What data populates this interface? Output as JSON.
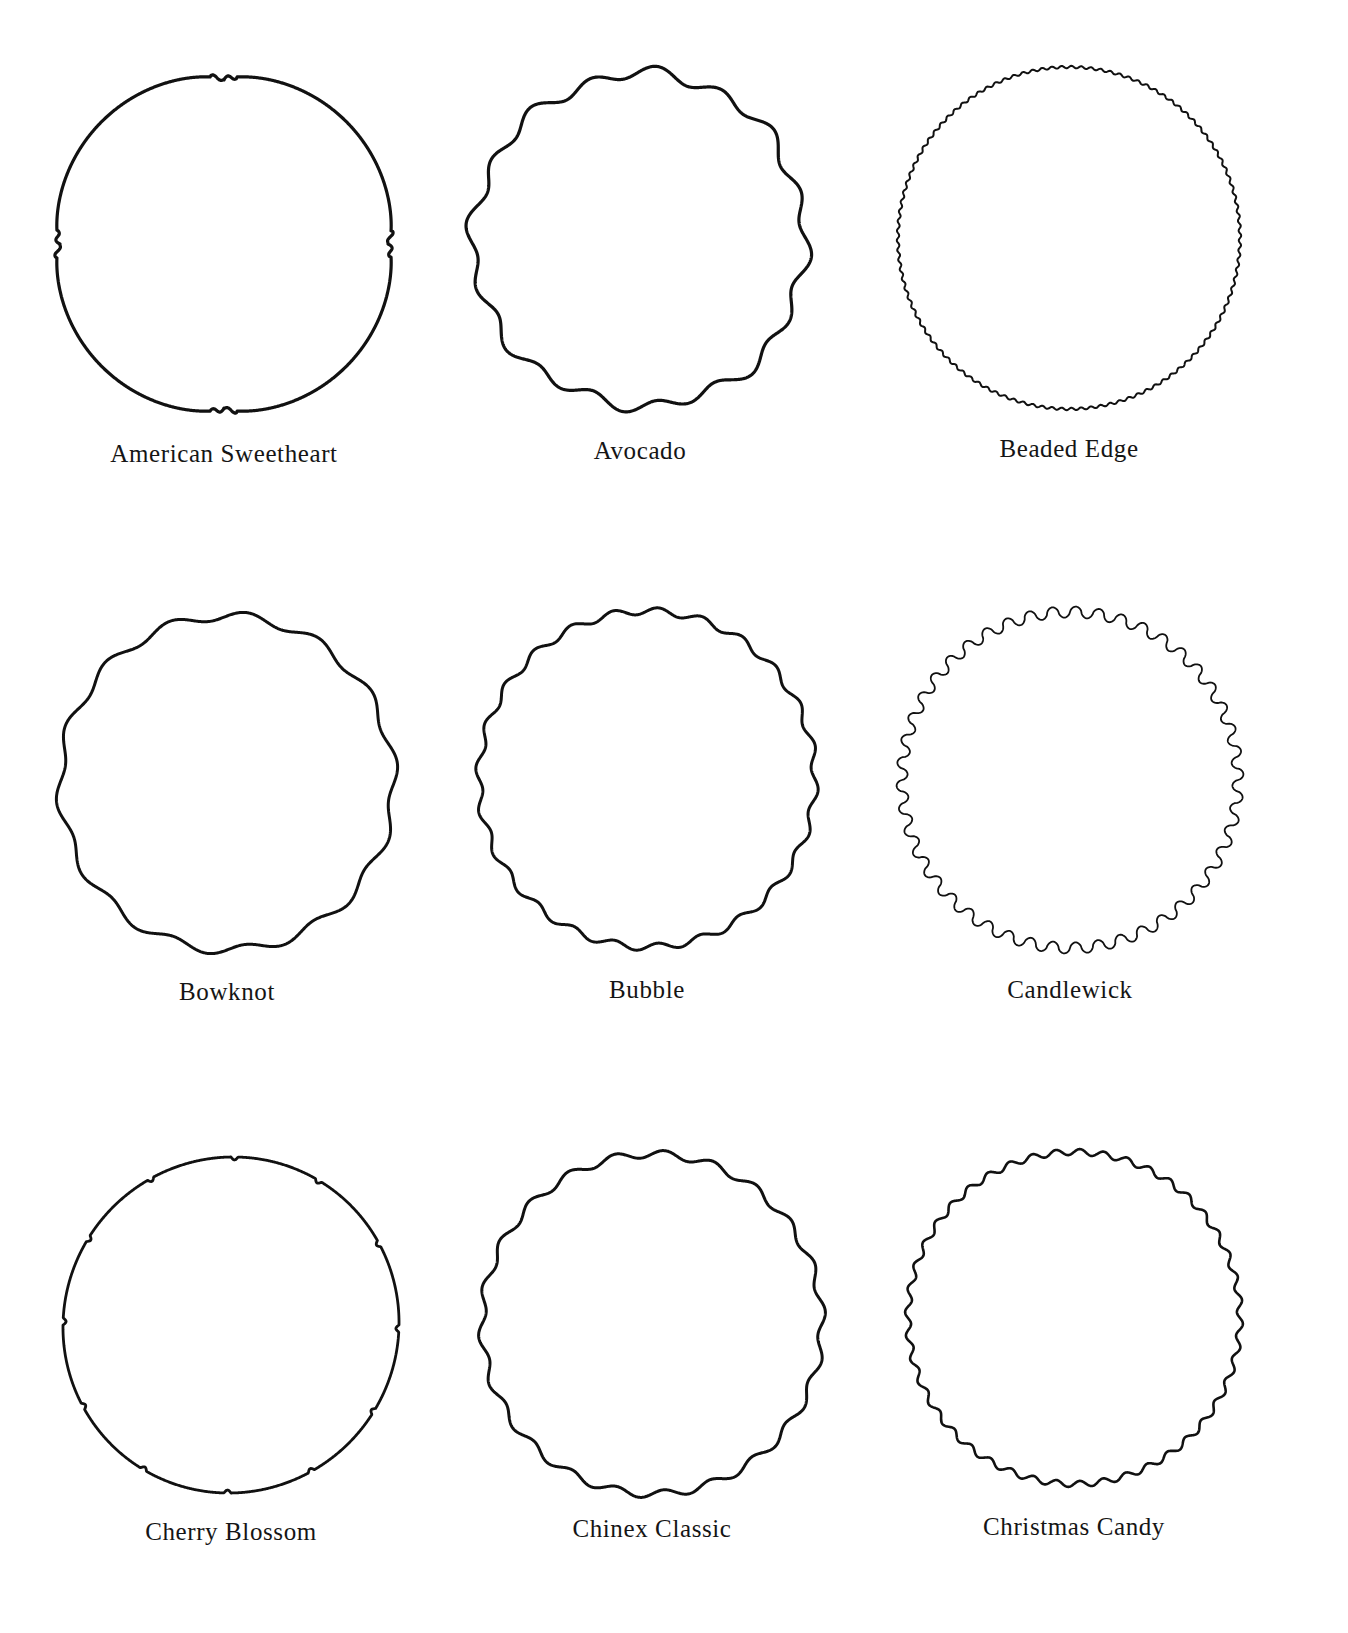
{
  "page": {
    "background": "#ffffff",
    "ink_color": "#111111"
  },
  "patterns": [
    {
      "name": "American Sweetheart",
      "cx": 224,
      "cy": 244,
      "r": 170,
      "style": "petal",
      "lobes": 4,
      "stroke": 3.2,
      "label_y": 440
    },
    {
      "name": "Avocado",
      "cx": 640,
      "cy": 240,
      "r": 166,
      "style": "irregular",
      "lobes": 16,
      "amp": 5.5,
      "stroke": 3.2,
      "label_y": 437
    },
    {
      "name": "Beaded Edge",
      "cx": 1069,
      "cy": 238,
      "r": 171,
      "style": "wave",
      "lobes": 110,
      "amp": 1.2,
      "stroke": 2,
      "label_y": 435
    },
    {
      "name": "Bowknot",
      "cx": 227,
      "cy": 783,
      "r": 167,
      "style": "wave",
      "lobes": 14,
      "amp": 4.5,
      "stroke": 3,
      "label_y": 978
    },
    {
      "name": "Bubble",
      "cx": 647,
      "cy": 779,
      "r": 168,
      "style": "wave",
      "lobes": 24,
      "amp": 3.5,
      "stroke": 3,
      "label_y": 976
    },
    {
      "name": "Candlewick",
      "cx": 1070,
      "cy": 780,
      "r": 168,
      "style": "bump",
      "lobes": 46,
      "amp": 5.5,
      "stroke": 1.8,
      "label_y": 976
    },
    {
      "name": "Cherry Blossom",
      "cx": 231,
      "cy": 1325,
      "r": 168,
      "style": "notch",
      "lobes": 12,
      "amp": 3,
      "stroke": 2.8,
      "label_y": 1518
    },
    {
      "name": "Chinex Classic",
      "cx": 652,
      "cy": 1324,
      "r": 170,
      "style": "wave",
      "lobes": 22,
      "amp": 3.8,
      "stroke": 3,
      "label_y": 1515
    },
    {
      "name": "Christmas Candy",
      "cx": 1074,
      "cy": 1318,
      "r": 166,
      "style": "wave",
      "lobes": 44,
      "amp": 3,
      "stroke": 2.6,
      "label_y": 1513
    }
  ]
}
